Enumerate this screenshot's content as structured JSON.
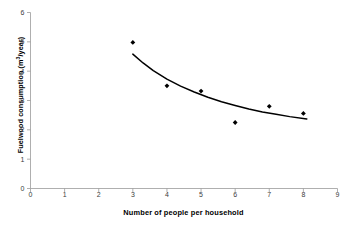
{
  "chart_data": {
    "type": "scatter",
    "title": "",
    "xlabel": "Number of people per household",
    "ylabel": "Fuelwood consumption (m3/year)",
    "ylabel_base": "Fuelwood consumption (m",
    "ylabel_sup": "3",
    "ylabel_tail": "/year)",
    "xlim": [
      0,
      9
    ],
    "ylim": [
      0,
      6
    ],
    "xticks": [
      0,
      1,
      2,
      3,
      4,
      5,
      6,
      7,
      8,
      9
    ],
    "yticks": [
      0,
      1,
      2,
      3,
      4,
      5,
      6
    ],
    "grid": false,
    "legend": false,
    "marker_color": "#000000",
    "line_color": "#000000",
    "axis_color": "#9a9a9a",
    "background": "#ffffff",
    "x": [
      3,
      4,
      5,
      6,
      7,
      8
    ],
    "y": [
      4.98,
      3.5,
      3.32,
      2.25,
      2.8,
      2.56
    ],
    "series": [
      {
        "name": "Fuelwood consumption",
        "marker": "diamond",
        "points": [
          {
            "x": 3,
            "y": 4.98
          },
          {
            "x": 4,
            "y": 3.5
          },
          {
            "x": 5,
            "y": 3.32
          },
          {
            "x": 6,
            "y": 2.25
          },
          {
            "x": 7,
            "y": 2.8
          },
          {
            "x": 8,
            "y": 2.56
          }
        ]
      },
      {
        "name": "Fitted trend curve",
        "type": "line",
        "points": [
          {
            "x": 3.0,
            "y": 4.58
          },
          {
            "x": 3.3,
            "y": 4.28
          },
          {
            "x": 3.6,
            "y": 4.02
          },
          {
            "x": 4.0,
            "y": 3.73
          },
          {
            "x": 4.4,
            "y": 3.49
          },
          {
            "x": 4.8,
            "y": 3.29
          },
          {
            "x": 5.2,
            "y": 3.11
          },
          {
            "x": 5.6,
            "y": 2.96
          },
          {
            "x": 6.0,
            "y": 2.83
          },
          {
            "x": 6.4,
            "y": 2.71
          },
          {
            "x": 6.8,
            "y": 2.61
          },
          {
            "x": 7.2,
            "y": 2.53
          },
          {
            "x": 7.6,
            "y": 2.45
          },
          {
            "x": 8.1,
            "y": 2.37
          }
        ]
      }
    ]
  },
  "axes": {
    "x_tick_labels": [
      "0",
      "1",
      "2",
      "3",
      "4",
      "5",
      "6",
      "7",
      "8",
      "9"
    ],
    "y_tick_labels": [
      "0",
      "1",
      "2",
      "3",
      "4",
      "5",
      "6"
    ]
  }
}
